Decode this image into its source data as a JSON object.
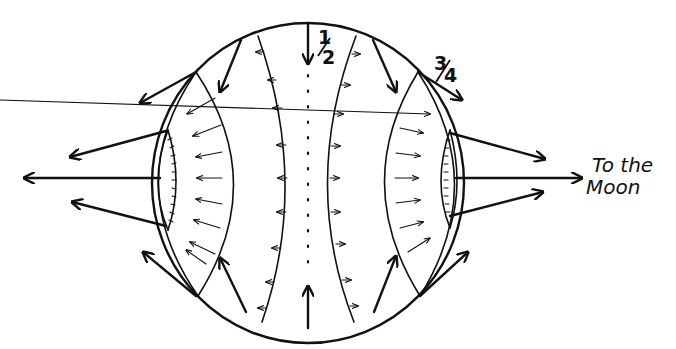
{
  "diagram": {
    "labels": {
      "half": "1/2",
      "half_num": "1",
      "half_den": "2",
      "three_quarter": "3/4",
      "tq_num": "3",
      "tq_den": "4",
      "moon_line1": "To the",
      "moon_line2": "Moon"
    },
    "colors": {
      "ink": "#111111",
      "background": "#ffffff"
    }
  }
}
